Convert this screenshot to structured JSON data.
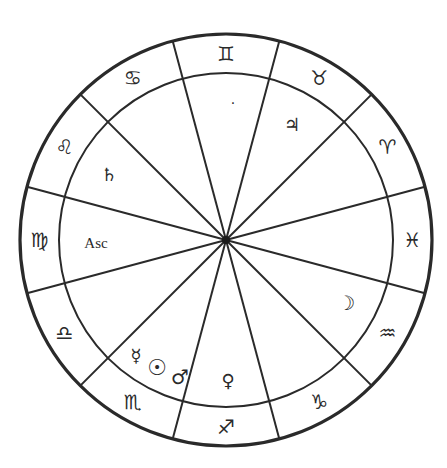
{
  "chart": {
    "type": "natal-astrological-wheel",
    "house_system": "equal",
    "center": [
      226,
      240
    ],
    "outer_radius": 206,
    "inner_radius": 167,
    "cusp_angles_deg": [
      15,
      45,
      75,
      105,
      135,
      165,
      195,
      225,
      255,
      285,
      315,
      345
    ],
    "line_color": "#2a2a2a"
  },
  "zodiac_ring": [
    {
      "name": "Virgo",
      "glyph": "♍",
      "angle": 180
    },
    {
      "name": "Libra",
      "glyph": "♎",
      "angle": 210
    },
    {
      "name": "Scorpio",
      "glyph": "♏",
      "angle": 240
    },
    {
      "name": "Sagittarius",
      "glyph": "♐",
      "angle": 270
    },
    {
      "name": "Capricorn",
      "glyph": "♑",
      "angle": 300
    },
    {
      "name": "Aquarius",
      "glyph": "♒",
      "angle": 330
    },
    {
      "name": "Pisces",
      "glyph": "♓",
      "angle": 0
    },
    {
      "name": "Aries",
      "glyph": "♈",
      "angle": 30
    },
    {
      "name": "Taurus",
      "glyph": "♉",
      "angle": 60
    },
    {
      "name": "Gemini",
      "glyph": "♊",
      "angle": 90
    },
    {
      "name": "Cancer",
      "glyph": "♋",
      "angle": 120
    },
    {
      "name": "Leo",
      "glyph": "♌",
      "angle": 150
    }
  ],
  "planets": [
    {
      "name": "Saturn",
      "glyph": "♄",
      "x": 109,
      "y": 174,
      "size": 18
    },
    {
      "name": "Point",
      "glyph": "·",
      "x": 233,
      "y": 103,
      "size": 14
    },
    {
      "name": "Jupiter",
      "glyph": "♃",
      "x": 292,
      "y": 124,
      "size": 18
    },
    {
      "name": "Moon",
      "glyph": "☽",
      "x": 346,
      "y": 303,
      "size": 20
    },
    {
      "name": "Venus",
      "glyph": "♀",
      "x": 228,
      "y": 380,
      "size": 18
    },
    {
      "name": "Mercury",
      "glyph": "☿",
      "x": 136,
      "y": 355,
      "size": 18
    },
    {
      "name": "Sun",
      "glyph": "☉",
      "x": 157,
      "y": 367,
      "size": 22
    },
    {
      "name": "Mars",
      "glyph": "♂",
      "x": 180,
      "y": 377,
      "size": 20
    }
  ],
  "ascendant": {
    "label": "Asc",
    "x": 96,
    "y": 243,
    "size": 15
  }
}
